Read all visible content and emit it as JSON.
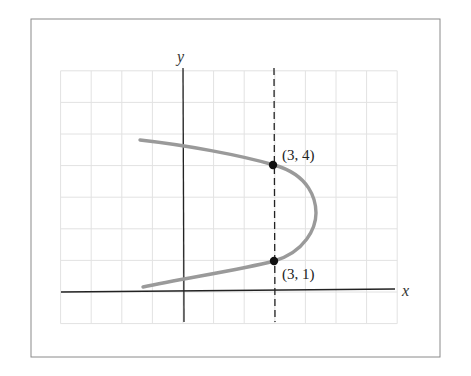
{
  "chart_data": {
    "type": "line",
    "title": "",
    "xlabel": "x",
    "ylabel": "y",
    "xlim": [
      -4,
      7
    ],
    "ylim": [
      -1,
      7
    ],
    "grid": true,
    "legend": null,
    "series": [
      {
        "name": "parabola (opens left, axis y = 2.5)",
        "style": "solid-gray",
        "points": [
          {
            "x": -1.4,
            "y": 4.9
          },
          {
            "x": 0,
            "y": 4.65
          },
          {
            "x": 3,
            "y": 4
          },
          {
            "x": 4.3,
            "y": 2.5
          },
          {
            "x": 3,
            "y": 1
          },
          {
            "x": 0,
            "y": 0.4
          },
          {
            "x": -1.3,
            "y": 0.15
          }
        ]
      },
      {
        "name": "vertical line x = 3",
        "style": "dashed",
        "points": [
          {
            "x": 3,
            "y": -1
          },
          {
            "x": 3,
            "y": 7
          }
        ]
      }
    ],
    "annotations": [
      {
        "text": "(3, 4)",
        "x": 3,
        "y": 4
      },
      {
        "text": "(3, 1)",
        "x": 3,
        "y": 1
      }
    ]
  },
  "labels": {
    "x_axis": "x",
    "y_axis": "y",
    "point_upper": "(3, 4)",
    "point_lower": "(3, 1)"
  }
}
